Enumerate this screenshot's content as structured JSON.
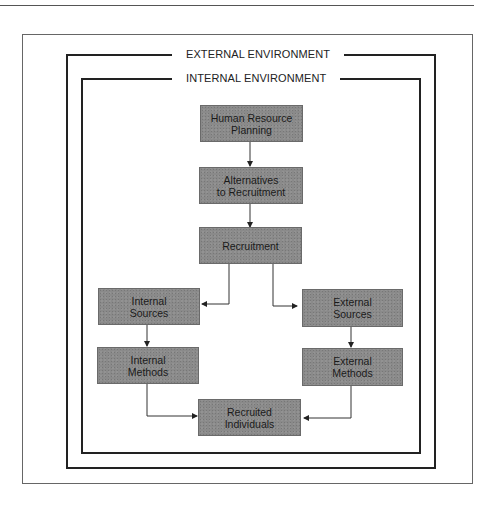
{
  "diagram": {
    "title_external": "EXTERNAL ENVIRONMENT",
    "title_internal": "INTERNAL ENVIRONMENT",
    "nodes": [
      {
        "id": "hrp",
        "label": "Human Resource\nPlanning"
      },
      {
        "id": "alt",
        "label": "Alternatives\nto Recruitment"
      },
      {
        "id": "rec",
        "label": "Recruitment"
      },
      {
        "id": "int_src",
        "label": "Internal\nSources"
      },
      {
        "id": "ext_src",
        "label": "External\nSources"
      },
      {
        "id": "int_meth",
        "label": "Internal\nMethods"
      },
      {
        "id": "ext_meth",
        "label": "External\nMethods"
      },
      {
        "id": "recruited",
        "label": "Recruited\nIndividuals"
      }
    ],
    "edges": [
      {
        "from": "hrp",
        "to": "alt"
      },
      {
        "from": "alt",
        "to": "rec"
      },
      {
        "from": "rec",
        "to": "int_src"
      },
      {
        "from": "rec",
        "to": "ext_src"
      },
      {
        "from": "int_src",
        "to": "int_meth"
      },
      {
        "from": "ext_src",
        "to": "ext_meth"
      },
      {
        "from": "int_meth",
        "to": "recruited"
      },
      {
        "from": "ext_meth",
        "to": "recruited"
      }
    ],
    "colors": {
      "box_fill": "#8a8a8a",
      "line": "#222222",
      "background": "#ffffff"
    }
  }
}
